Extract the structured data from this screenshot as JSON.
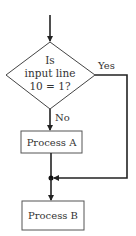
{
  "diagram": {
    "type": "flowchart",
    "colors": {
      "stroke": "#222222",
      "text": "#333333",
      "background": "#ffffff"
    },
    "decision": {
      "lines": [
        "Is",
        "input line",
        "10 = 1?"
      ],
      "yes_label": "Yes",
      "no_label": "No"
    },
    "process_a": {
      "label": "Process A"
    },
    "process_b": {
      "label": "Process B"
    }
  }
}
